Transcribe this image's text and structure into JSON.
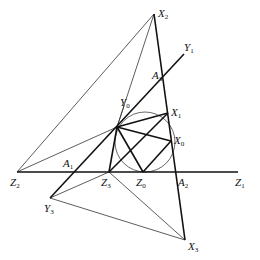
{
  "diagram": {
    "type": "geometry",
    "points": {
      "X2": [
        154,
        14
      ],
      "Y1": [
        184,
        54
      ],
      "A3": [
        164,
        78
      ],
      "P": [
        117,
        127
      ],
      "X1": [
        168,
        113
      ],
      "X0": [
        171,
        141
      ],
      "Z2": [
        17,
        172
      ],
      "A1": [
        73,
        172
      ],
      "Z3": [
        109,
        172
      ],
      "Z0": [
        143,
        172
      ],
      "A2": [
        175,
        172
      ],
      "Z1": [
        238,
        172
      ],
      "Y3": [
        50,
        198
      ],
      "X3": [
        185,
        240
      ]
    },
    "circle": {
      "cx": 145,
      "cy": 142,
      "r": 30
    },
    "labels": [
      {
        "base": "X",
        "sub": "2",
        "x": 158,
        "y": 8
      },
      {
        "base": "Y",
        "sub": "1",
        "x": 184,
        "y": 42
      },
      {
        "base": "A",
        "sub": "3",
        "x": 152,
        "y": 70
      },
      {
        "base": "Y",
        "sub": "0",
        "x": 120,
        "y": 97
      },
      {
        "base": "X",
        "sub": "1",
        "x": 171,
        "y": 107
      },
      {
        "base": "X",
        "sub": "0",
        "x": 174,
        "y": 135
      },
      {
        "base": "A",
        "sub": "1",
        "x": 63,
        "y": 158
      },
      {
        "base": "Z",
        "sub": "2",
        "x": 10,
        "y": 177
      },
      {
        "base": "Z",
        "sub": "3",
        "x": 101,
        "y": 177
      },
      {
        "base": "Z",
        "sub": "0",
        "x": 136,
        "y": 177
      },
      {
        "base": "A",
        "sub": "2",
        "x": 178,
        "y": 177
      },
      {
        "base": "Z",
        "sub": "1",
        "x": 235,
        "y": 177
      },
      {
        "base": "Y",
        "sub": "3",
        "x": 44,
        "y": 203
      },
      {
        "base": "X",
        "sub": "3",
        "x": 188,
        "y": 241
      }
    ]
  }
}
